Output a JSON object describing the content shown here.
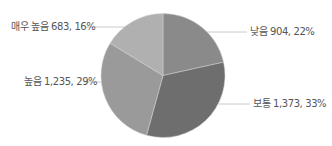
{
  "chart_data": {
    "type": "pie",
    "title": "",
    "start_angle": "12 o'clock",
    "direction": "clockwise",
    "categories": [
      "낮음",
      "보통",
      "높음",
      "매우 높음"
    ],
    "values": [
      904,
      1373,
      1235,
      683
    ],
    "percents": [
      22,
      33,
      29,
      16
    ],
    "colors": [
      "#8a8a8a",
      "#6e6e6e",
      "#9a9a9a",
      "#b0b0b0"
    ],
    "labels": [
      "낮음 904, 22%",
      "보통 1,373, 33%",
      "높음 1,235, 29%",
      "매우 높음 683, 16%"
    ],
    "legend": "none (data labels with leader lines)"
  }
}
